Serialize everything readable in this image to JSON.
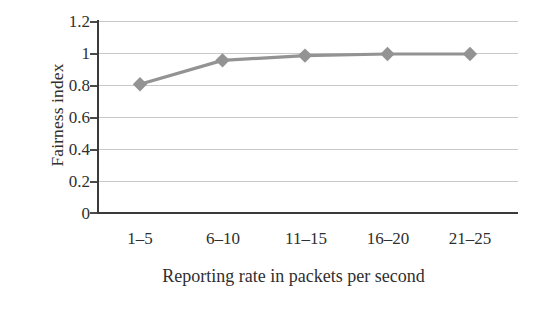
{
  "chart_data": {
    "type": "line",
    "title": "",
    "xlabel": "Reporting rate in packets per second",
    "ylabel": "Fairness index",
    "categories": [
      "1–5",
      "6–10",
      "11–15",
      "16–20",
      "21–25"
    ],
    "series": [
      {
        "name": "Fairness index",
        "values": [
          0.81,
          0.96,
          0.99,
          1.0,
          1.0
        ],
        "color": "#939393",
        "marker": "diamond"
      }
    ],
    "ylim": [
      0,
      1.2
    ],
    "yticks": [
      0,
      0.2,
      0.4,
      0.6,
      0.8,
      1,
      1.2
    ],
    "ytick_labels": [
      "0",
      "0.2",
      "0.4",
      "0.6",
      "0.8",
      "1",
      "1.2"
    ],
    "grid": true,
    "grid_axis": "y",
    "grid_color": "#c9c9c9",
    "axis_color": "#3a3a3a",
    "legend": false,
    "legend_position": "none"
  }
}
